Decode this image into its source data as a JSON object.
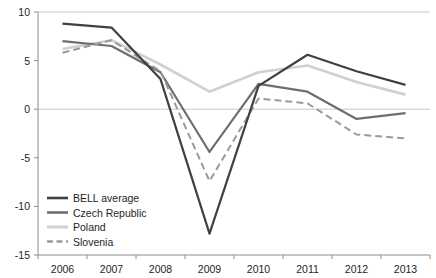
{
  "chart_data": {
    "type": "line",
    "title": "",
    "xlabel": "",
    "ylabel": "",
    "x": [
      2006,
      2007,
      2008,
      2009,
      2010,
      2011,
      2012,
      2013
    ],
    "xtick_labels": [
      "2006",
      "2007",
      "2008",
      "2009",
      "2010",
      "2011",
      "2012",
      "2013"
    ],
    "ytick_labels": [
      "10",
      "5",
      "0",
      "-5",
      "-10",
      "-15"
    ],
    "yticks": [
      10,
      5,
      0,
      -5,
      -10,
      -15
    ],
    "ylim": [
      -15,
      10
    ],
    "grid": "horizontal gridlines at 10 and 0 only",
    "legend_position": "bottom-left inside plot area",
    "series": [
      {
        "name": "BELL average",
        "color": "#404040",
        "style": "solid",
        "width": 2.2,
        "values": [
          8.8,
          8.4,
          3.1,
          -12.8,
          2.4,
          5.6,
          3.9,
          2.5
        ]
      },
      {
        "name": "Czech Republic",
        "color": "#6e6e6e",
        "style": "solid",
        "width": 2.2,
        "values": [
          7.0,
          6.5,
          3.8,
          -4.4,
          2.6,
          1.8,
          -1.0,
          -0.4
        ]
      },
      {
        "name": "Poland",
        "color": "#d0d0d0",
        "style": "solid",
        "width": 2.6,
        "values": [
          6.2,
          7.1,
          4.6,
          1.8,
          3.8,
          4.5,
          2.8,
          1.5
        ]
      },
      {
        "name": "Slovenia",
        "color": "#9a9a9a",
        "style": "dashed",
        "width": 2.0,
        "values": [
          5.8,
          7.1,
          3.9,
          -7.4,
          1.1,
          0.6,
          -2.6,
          -3.0
        ]
      }
    ]
  },
  "legend": {
    "items": [
      {
        "label": "BELL average"
      },
      {
        "label": "Czech Republic"
      },
      {
        "label": "Poland"
      },
      {
        "label": "Slovenia"
      }
    ]
  }
}
